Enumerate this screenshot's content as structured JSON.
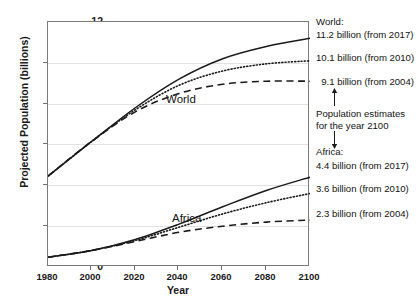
{
  "chart_data": {
    "type": "line",
    "title": "",
    "xlabel": "Year",
    "ylabel": "Projected Population (billions)",
    "xlim": [
      1980,
      2100
    ],
    "ylim": [
      0,
      12
    ],
    "xticks": [
      "1980",
      "2000",
      "2020",
      "2040",
      "2060",
      "2080",
      "2100"
    ],
    "yticks": [
      "0",
      "2",
      "4",
      "6",
      "8",
      "10",
      "12"
    ],
    "grid": "horizontal",
    "legend_position": "right-annotations",
    "x": [
      1980,
      2000,
      2020,
      2040,
      2060,
      2080,
      2100
    ],
    "series": [
      {
        "name": "World (from 2017)",
        "region": "World",
        "revision": "2017",
        "style": "solid",
        "values": [
          4.45,
          6.15,
          7.8,
          9.2,
          10.2,
          10.8,
          11.2
        ]
      },
      {
        "name": "World (from 2010)",
        "region": "World",
        "revision": "2010",
        "style": "dotted",
        "values": [
          4.45,
          6.15,
          7.7,
          8.9,
          9.6,
          9.95,
          10.1
        ]
      },
      {
        "name": "World (from 2004)",
        "region": "World",
        "revision": "2004",
        "style": "dashed",
        "values": [
          4.45,
          6.15,
          7.6,
          8.5,
          8.95,
          9.1,
          9.1
        ]
      },
      {
        "name": "Africa (from 2017)",
        "region": "Africa",
        "revision": "2017",
        "style": "solid",
        "values": [
          0.48,
          0.81,
          1.35,
          2.1,
          2.95,
          3.75,
          4.4
        ]
      },
      {
        "name": "Africa (from 2010)",
        "region": "Africa",
        "revision": "2010",
        "style": "dotted",
        "values": [
          0.48,
          0.81,
          1.3,
          1.95,
          2.6,
          3.15,
          3.6
        ]
      },
      {
        "name": "Africa (from 2004)",
        "region": "Africa",
        "revision": "2004",
        "style": "dashed",
        "values": [
          0.48,
          0.81,
          1.25,
          1.7,
          2.0,
          2.2,
          2.3
        ]
      }
    ],
    "inline_labels": [
      {
        "text": "World",
        "x": 2016,
        "y": 8.6
      },
      {
        "text": "Africa",
        "x": 2019,
        "y": 2.9
      }
    ],
    "annotations": {
      "world_heading": "World:",
      "world_values": [
        "11.2 billion (from 2017)",
        "10.1 billion (from 2010)",
        "9.1 billion (from 2004)"
      ],
      "note_line1": "Population estimates",
      "note_line2": "for the year 2100",
      "arrow_up": "↑",
      "arrow_down": "↓",
      "africa_heading": "Africa:",
      "africa_values": [
        "4.4 billion (from 2017)",
        "3.6 billion (from 2010)",
        "2.3 billion (from 2004)"
      ]
    },
    "colors": {
      "line": "#1a1a1a",
      "grid": "#e2e2e2",
      "frame": "#7a7a7a",
      "background": "#ffffff"
    }
  }
}
